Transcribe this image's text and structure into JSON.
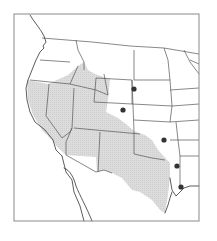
{
  "map": {
    "title": "",
    "region": "Western United States",
    "colors": {
      "background": "#ffffff",
      "frame": "#8a8a8a",
      "range_fill": "#d9d9d9",
      "lines": "#4a4a4a",
      "dot": "#333333"
    },
    "frame": {
      "x": 14,
      "y": 14,
      "width": 185,
      "height": 207
    },
    "range_shading": [
      "M27,80 L48,84 L68,75 L78,66 L84,62 L88,70 L95,74 L110,79 L108,100 L106,112 L118,118 L126,124 L134,131 L145,135 L152,140 L158,150 L170,163 L170,178 L168,195 L165,213 L160,210 L152,200 L140,192 L132,190 L122,178 L112,173 L104,170 L97,172 L96,157 L80,156 L66,155 L58,148 L52,140 L42,130 L33,115 L28,100 Z"
    ],
    "coast_and_borders": [
      "M30,15 C34,22 40,28 44,36 L46,42 L43,46 L44,48 L40,52 L36,60 L32,70 L28,80 L26,88 L27,100 L30,112 L35,122 L45,130 L53,140 L56,150 L62,156",
      "M62,156 L66,172 L72,180 L74,192 L80,206 L84,221",
      "M64,168 C70,170 74,178 76,186 C80,196 86,206 92,221",
      "M170,178 L172,190 L176,196 L180,192 L184,188 L190,186 L199,186",
      "M165,213 L168,205 L170,198 L172,192"
    ],
    "state_lines": [
      "M42,38 L92,42 L130,46 L164,48 L199,54",
      "M40,60 L70,62",
      "M30,80 L70,84 L78,66",
      "M70,84 L96,90 L108,95",
      "M76,40 L78,50 L84,62 L84,70",
      "M49,84 L46,116 L62,138 L70,132 L72,128",
      "M72,128 L74,88",
      "M74,128 L140,134",
      "M72,128 L66,142 L66,155 L96,172",
      "M100,132 L98,172",
      "M96,172 L104,170 L112,173",
      "M134,131 L134,154 L152,158 L165,160",
      "M134,120 L170,122 L199,120",
      "M96,78 L132,80 L134,131",
      "M96,78 L94,102 L132,104",
      "M132,104 L172,106",
      "M134,50 L134,80 L170,80",
      "M164,48 L168,60 L170,80 L172,106 L170,122",
      "M132,80 L132,104",
      "M104,74 L108,95",
      "M176,122 L178,140 L180,156 L199,156",
      "M170,140 L199,140",
      "M172,106 L199,104",
      "M170,90 L199,88",
      "M180,156 L180,186",
      "M190,60 L199,64",
      "M184,50 L190,62 L196,70 L199,74"
    ],
    "occurrence_points": [
      {
        "x": 134,
        "y": 89,
        "r": 2.6
      },
      {
        "x": 123,
        "y": 110,
        "r": 2.6
      },
      {
        "x": 164,
        "y": 140,
        "r": 2.6
      },
      {
        "x": 177,
        "y": 166,
        "r": 2.6
      },
      {
        "x": 181,
        "y": 187,
        "r": 2.6
      }
    ]
  }
}
